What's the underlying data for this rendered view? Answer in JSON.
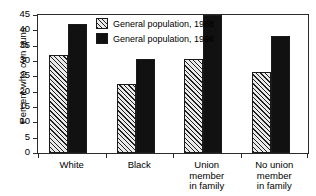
{
  "chart_data": {
    "type": "bar",
    "title": "",
    "subtitle": "",
    "xlabel": "",
    "ylabel": "Percent who own guns",
    "ylim": [
      0,
      45
    ],
    "yticks": [
      0,
      5,
      10,
      15,
      20,
      25,
      30,
      35,
      40,
      45
    ],
    "ytick_labels": [
      "0",
      "5",
      "10",
      "15",
      "20",
      "25",
      "30",
      "35",
      "40",
      "45"
    ],
    "grid": false,
    "legend_position": "top-center",
    "categories": [
      "White",
      "Black",
      "Union member in family",
      "No union member in family"
    ],
    "category_lines": [
      [
        "White"
      ],
      [
        "Black"
      ],
      [
        "Union",
        "member",
        "in family"
      ],
      [
        "No union",
        "member",
        "in family"
      ]
    ],
    "series": [
      {
        "name": "General population, 1988",
        "fill": "diagonal-hatch",
        "color": "#e9e9e9",
        "values": [
          32,
          22.5,
          30.5,
          26.5
        ]
      },
      {
        "name": "General population, 1996",
        "fill": "solid",
        "color": "#111111",
        "values": [
          42,
          30.5,
          45,
          38
        ]
      }
    ],
    "annotations": []
  },
  "colors": {
    "axis": "#2b2b2b",
    "background": "#ffffff",
    "text": "#000000",
    "series_1988": "#e9e9e9",
    "series_1996": "#111111"
  }
}
